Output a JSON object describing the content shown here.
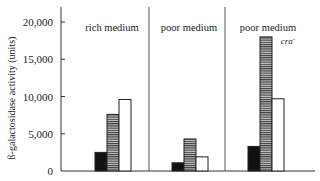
{
  "chart_data": {
    "type": "bar",
    "title": "",
    "xlabel": "",
    "ylabel": "ß-galactosidase activity (units)",
    "ylim": [
      0,
      20000
    ],
    "yticks": [
      0,
      5000,
      10000,
      15000,
      20000
    ],
    "ytick_labels": [
      "0",
      "5,000",
      "10,000",
      "15,000",
      "20,000"
    ],
    "grid": false,
    "legend": "none",
    "categories": [
      "rich medium",
      "poor medium",
      "poor medium cra-"
    ],
    "category_labels": [
      {
        "line1": "rich medium",
        "line2": ""
      },
      {
        "line1": "poor medium",
        "line2": ""
      },
      {
        "line1": "poor medium",
        "line2": "cra",
        "superscript": "-"
      }
    ],
    "series": [
      {
        "name": "black bar",
        "fill": "black",
        "values": [
          2500,
          1100,
          3300
        ]
      },
      {
        "name": "striped bar",
        "fill": "horizontal-stripes",
        "values": [
          7600,
          4300,
          18000
        ]
      },
      {
        "name": "white bar",
        "fill": "white",
        "values": [
          9600,
          1900,
          9700
        ]
      }
    ]
  },
  "colors": {
    "axis": "#333333",
    "black_bar": "#111111",
    "stripe_dark": "#444444",
    "stripe_light": "#bbbbbb",
    "white_bar": "#ffffff"
  }
}
